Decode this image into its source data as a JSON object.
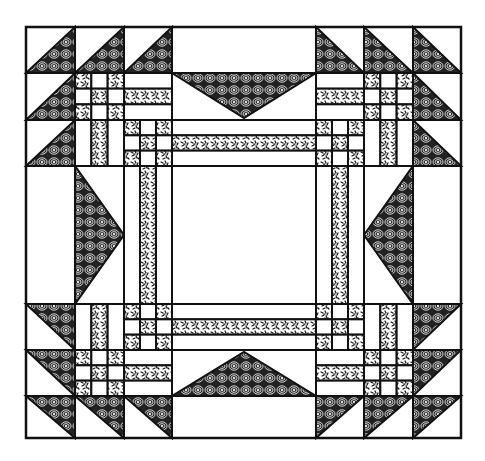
{
  "diagram": {
    "colors": {
      "ink": "#111111",
      "background": "#ffffff"
    },
    "fabrics": [
      "concentric-oval-print",
      "speckle-print"
    ],
    "grid": {
      "cols": [
        26,
        75,
        124,
        172,
        316,
        364,
        413,
        461
      ],
      "rows": [
        27,
        73,
        120,
        166,
        304,
        350,
        396,
        438
      ]
    }
  }
}
